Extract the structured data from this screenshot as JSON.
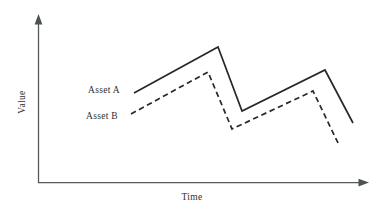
{
  "chart_data": {
    "type": "line",
    "title": "",
    "subtitle": "",
    "xlabel": "Time",
    "ylabel": "Value",
    "xlim": [
      0,
      100
    ],
    "ylim": [
      0,
      100
    ],
    "grid": false,
    "axis_ticks": false,
    "tick_labels": {
      "x": [],
      "y": []
    },
    "legend": {
      "position": "inline-left",
      "entries": [
        {
          "name": "Asset A",
          "style": "solid"
        },
        {
          "name": "Asset B",
          "style": "dashed"
        }
      ]
    },
    "annotations": [
      {
        "text": "Asset A",
        "x": 29,
        "y": 61
      },
      {
        "text": "Asset B",
        "x": 28,
        "y": 47
      }
    ],
    "series": [
      {
        "name": "Asset A",
        "style": "solid",
        "x": [
          29,
          55,
          62,
          83,
          100
        ],
        "y": [
          61,
          88,
          50,
          76,
          39
        ],
        "points_px": [
          {
            "x": 134,
            "y": 93
          },
          {
            "x": 218,
            "y": 47
          },
          {
            "x": 242,
            "y": 111
          },
          {
            "x": 325,
            "y": 70
          },
          {
            "x": 353,
            "y": 123
          }
        ]
      },
      {
        "name": "Asset B",
        "style": "dashed",
        "x": [
          28,
          52,
          59,
          80,
          95
        ],
        "y": [
          47,
          73,
          36,
          62,
          25
        ],
        "points_px": [
          {
            "x": 131,
            "y": 114
          },
          {
            "x": 208,
            "y": 72
          },
          {
            "x": 232,
            "y": 129
          },
          {
            "x": 313,
            "y": 91
          },
          {
            "x": 339,
            "y": 145
          }
        ]
      }
    ]
  },
  "axes": {
    "y_label": "Value",
    "x_label": "Time",
    "y_axis_name": "value-axis",
    "x_axis_name": "time-axis"
  },
  "labels": {
    "asset_a": "Asset A",
    "asset_b": "Asset B",
    "time": "Time",
    "value": "Value"
  },
  "colors": {
    "line": "#282828",
    "axis": "#555a5d",
    "text": "#2f2f2f",
    "background": "#ffffff"
  }
}
